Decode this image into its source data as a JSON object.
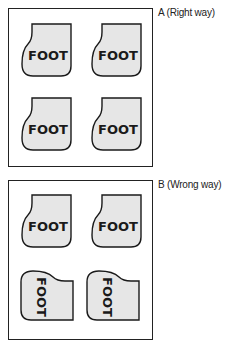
{
  "panels": [
    {
      "id": "A",
      "label": "A (Right way)",
      "tiles": [
        {
          "text": "FOOT",
          "orientation": "upright"
        },
        {
          "text": "FOOT",
          "orientation": "upright"
        },
        {
          "text": "FOOT",
          "orientation": "upright"
        },
        {
          "text": "FOOT",
          "orientation": "upright"
        }
      ]
    },
    {
      "id": "B",
      "label": "B (Wrong way)",
      "tiles": [
        {
          "text": "FOOT",
          "orientation": "upright"
        },
        {
          "text": "FOOT",
          "orientation": "upright"
        },
        {
          "text": "FOOT",
          "orientation": "rotated-90"
        },
        {
          "text": "FOOT",
          "orientation": "rotated-90"
        }
      ]
    }
  ],
  "colors": {
    "tile_fill": "#e6e6e6",
    "stroke": "#1a1a1a",
    "background": "#ffffff"
  }
}
